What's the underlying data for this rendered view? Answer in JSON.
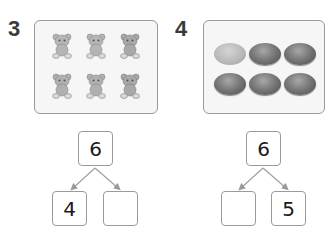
{
  "problems": [
    {
      "number": "3",
      "picture": {
        "item": "bear-icon",
        "count": 6,
        "rows": 2,
        "cols": 3
      },
      "number_bond": {
        "whole": "6",
        "part_left": "4",
        "part_right": ""
      }
    },
    {
      "number": "4",
      "picture": {
        "item": "egg-icon",
        "count": 6,
        "rows": 2,
        "cols": 3,
        "highlighted": 1
      },
      "number_bond": {
        "whole": "6",
        "part_left": "",
        "part_right": "5"
      }
    }
  ],
  "colors": {
    "border": "#9a9a9a",
    "text": "#1a1a1a",
    "panel_bg": "#f6f6f6"
  }
}
